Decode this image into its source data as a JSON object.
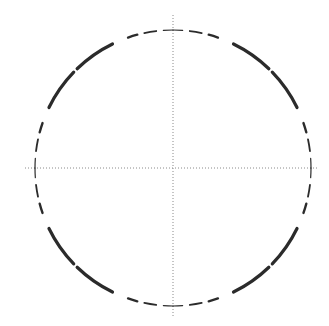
{
  "diagram": {
    "type": "segmented-circle-with-crosshair",
    "canvas": {
      "width": 329,
      "height": 326,
      "background": "#ffffff"
    },
    "center": {
      "x": 173,
      "y": 168
    },
    "radius": 138,
    "stroke_color": "#2b2b2b",
    "crosshair": {
      "color": "#8a8a8a",
      "horizontal": {
        "x1": 25,
        "x2": 318,
        "y": 168
      },
      "vertical": {
        "x": 173,
        "y1": 15,
        "y2": 318
      },
      "style": "dotted"
    },
    "quadrant_pattern_deg": [
      {
        "from": 0,
        "to": 4,
        "width": 1.2,
        "kind": "dash"
      },
      {
        "from": 7,
        "to": 12,
        "width": 1.8,
        "kind": "dash"
      },
      {
        "from": 15,
        "to": 19,
        "width": 2.4,
        "kind": "dash"
      },
      {
        "from": 26,
        "to": 44,
        "width": 3.2,
        "kind": "solid-arc"
      },
      {
        "from": 46,
        "to": 64,
        "width": 3.2,
        "kind": "solid-arc"
      },
      {
        "from": 71,
        "to": 75,
        "width": 2.4,
        "kind": "dash"
      },
      {
        "from": 78,
        "to": 83,
        "width": 1.8,
        "kind": "dash"
      },
      {
        "from": 86,
        "to": 90,
        "width": 1.2,
        "kind": "dash"
      }
    ]
  }
}
